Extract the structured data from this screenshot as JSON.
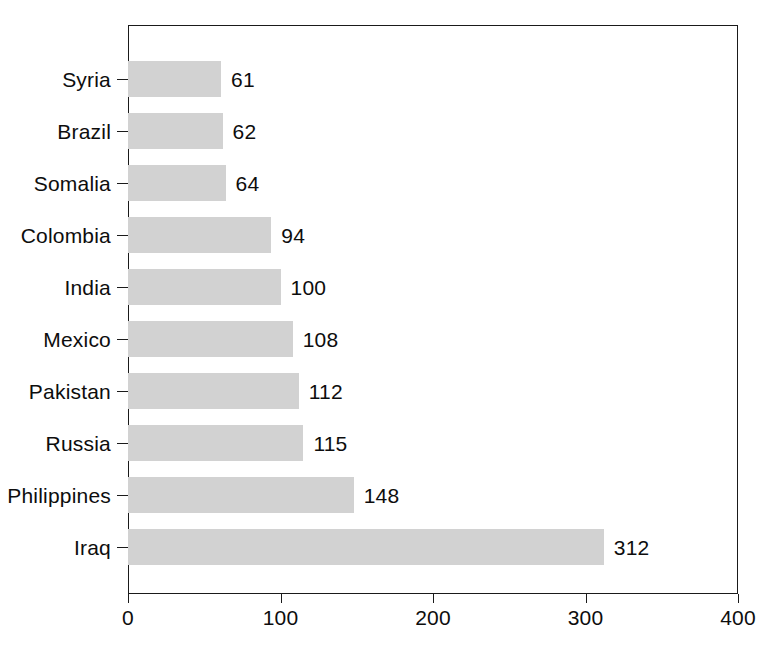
{
  "chart_data": {
    "type": "bar",
    "orientation": "horizontal",
    "title": "",
    "subtitle": "",
    "xlabel": "",
    "ylabel": "",
    "categories": [
      "Syria",
      "Brazil",
      "Somalia",
      "Colombia",
      "India",
      "Mexico",
      "Pakistan",
      "Russia",
      "Philippines",
      "Iraq"
    ],
    "values": [
      61,
      62,
      64,
      94,
      100,
      108,
      112,
      115,
      148,
      312
    ],
    "value_labels": [
      "61",
      "62",
      "64",
      "94",
      "100",
      "108",
      "112",
      "115",
      "148",
      "312"
    ],
    "xlim": [
      0,
      400
    ],
    "xticks": [
      0,
      100,
      200,
      300,
      400
    ],
    "xtick_labels": [
      "0",
      "100",
      "200",
      "300",
      "400"
    ],
    "grid": false,
    "legend": null,
    "bar_color": "#d2d2d2",
    "frame_color": "#1a1a1a",
    "background_color": "#ffffff",
    "text_color": "#0d0d0d",
    "annotations": []
  }
}
